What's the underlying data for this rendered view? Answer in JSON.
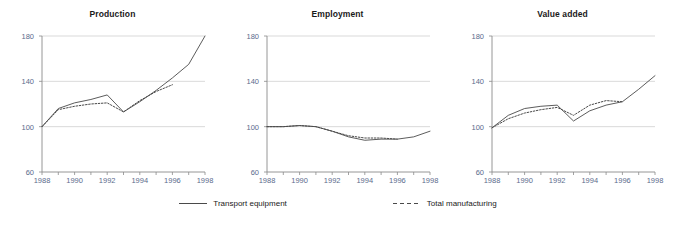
{
  "chart_data": [
    {
      "type": "line",
      "title": "Production",
      "xlabel": "",
      "ylabel": "",
      "xlim": [
        1988,
        1998
      ],
      "ylim": [
        60,
        180
      ],
      "yticks": [
        60,
        100,
        140,
        180
      ],
      "ytick_labels": [
        "60",
        "100",
        "140",
        "180"
      ],
      "xticks": [
        1988,
        1989,
        1990,
        1991,
        1992,
        1993,
        1994,
        1995,
        1996,
        1997,
        1998
      ],
      "xtick_labels": [
        "1988",
        "",
        "1990",
        "",
        "1992",
        "",
        "1994",
        "",
        "1996",
        "",
        "1998"
      ],
      "grid": "horizontal",
      "x": [
        1988,
        1989,
        1990,
        1991,
        1992,
        1993,
        1994,
        1995,
        1996,
        1997,
        1998
      ],
      "series": [
        {
          "name": "Transport equipment",
          "style": "solid",
          "values": [
            100,
            116,
            121,
            124,
            128,
            113,
            122,
            132,
            143,
            155,
            180
          ]
        },
        {
          "name": "Total manufacturing",
          "style": "dotted",
          "values": [
            100,
            115,
            118,
            120,
            121,
            113,
            123,
            131,
            137,
            null,
            null
          ]
        }
      ]
    },
    {
      "type": "line",
      "title": "Employment",
      "xlabel": "",
      "ylabel": "",
      "xlim": [
        1988,
        1998
      ],
      "ylim": [
        60,
        180
      ],
      "yticks": [
        60,
        100,
        140,
        180
      ],
      "ytick_labels": [
        "60",
        "100",
        "140",
        "180"
      ],
      "xticks": [
        1988,
        1989,
        1990,
        1991,
        1992,
        1993,
        1994,
        1995,
        1996,
        1997,
        1998
      ],
      "xtick_labels": [
        "1988",
        "",
        "1990",
        "",
        "1992",
        "",
        "1994",
        "",
        "1996",
        "",
        "1998"
      ],
      "grid": "horizontal",
      "x": [
        1988,
        1989,
        1990,
        1991,
        1992,
        1993,
        1994,
        1995,
        1996,
        1997,
        1998
      ],
      "series": [
        {
          "name": "Transport equipment",
          "style": "solid",
          "values": [
            100,
            100,
            101,
            100,
            96,
            91,
            88,
            89,
            89,
            91,
            96
          ]
        },
        {
          "name": "Total manufacturing",
          "style": "dotted",
          "values": [
            100,
            100,
            101,
            100,
            96,
            92,
            90,
            90,
            89,
            null,
            null
          ]
        }
      ]
    },
    {
      "type": "line",
      "title": "Value added",
      "xlabel": "",
      "ylabel": "",
      "xlim": [
        1988,
        1998
      ],
      "ylim": [
        60,
        180
      ],
      "yticks": [
        60,
        100,
        140,
        180
      ],
      "ytick_labels": [
        "60",
        "100",
        "140",
        "180"
      ],
      "xticks": [
        1988,
        1989,
        1990,
        1991,
        1992,
        1993,
        1994,
        1995,
        1996,
        1997,
        1998
      ],
      "xtick_labels": [
        "1988",
        "",
        "1990",
        "",
        "1992",
        "",
        "1994",
        "",
        "1996",
        "",
        "1998"
      ],
      "grid": "horizontal",
      "x": [
        1988,
        1989,
        1990,
        1991,
        1992,
        1993,
        1994,
        1995,
        1996,
        1997,
        1998
      ],
      "series": [
        {
          "name": "Transport equipment",
          "style": "solid",
          "values": [
            99,
            110,
            116,
            118,
            119,
            105,
            114,
            119,
            122,
            133,
            145
          ]
        },
        {
          "name": "Total manufacturing",
          "style": "dotted",
          "values": [
            99,
            107,
            112,
            115,
            117,
            110,
            119,
            123,
            122,
            null,
            null
          ]
        }
      ]
    }
  ],
  "legend": {
    "position": "bottom-center",
    "items": [
      {
        "label": "Transport equipment",
        "style": "solid"
      },
      {
        "label": "Total manufacturing",
        "style": "dashed"
      }
    ]
  },
  "colors": {
    "series_line": "#4a4a4a",
    "grid": "#cfcfcf",
    "axis": "#8a8a8a",
    "tick_label": "#5b6b8c",
    "title": "#1a1a1a",
    "background": "#ffffff"
  }
}
